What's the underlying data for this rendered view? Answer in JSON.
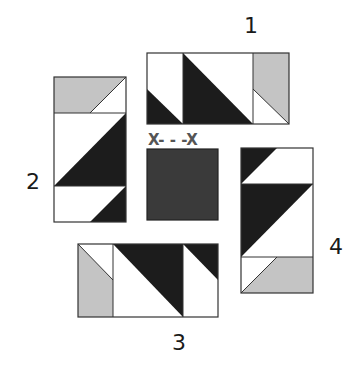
{
  "diagram": {
    "colors": {
      "dark": "#1c1c1c",
      "light": "#ffffff",
      "gray": "#c4c4c4",
      "center": "#3a3a3a",
      "outline": "#555555",
      "label": "#1a1a1a",
      "center_label": "#555555"
    },
    "labels": {
      "unit1": "1",
      "unit2": "2",
      "unit3": "3",
      "unit4": "4",
      "center": "X- - -X"
    },
    "units": [
      {
        "id": "1",
        "orientation": "horizontal",
        "position": "top",
        "segments": [
          "light-over-dark triangle square",
          "dark-over-light diagonal rectangle",
          "gray-over-light triangle square"
        ]
      },
      {
        "id": "2",
        "orientation": "vertical",
        "position": "left",
        "segments": [
          "gray-light triangle square",
          "light-dark diagonal rectangle",
          "light-dark triangle square"
        ]
      },
      {
        "id": "3",
        "orientation": "horizontal",
        "position": "bottom",
        "segments": [
          "gray-light triangle square",
          "dark-light diagonal rectangle",
          "dark-light triangle square"
        ]
      },
      {
        "id": "4",
        "orientation": "vertical",
        "position": "right",
        "segments": [
          "dark-light triangle square",
          "dark-light diagonal rectangle",
          "light-gray triangle square"
        ]
      }
    ],
    "center_square": {
      "fill": "dark gray",
      "marker": "X- - -X"
    }
  }
}
